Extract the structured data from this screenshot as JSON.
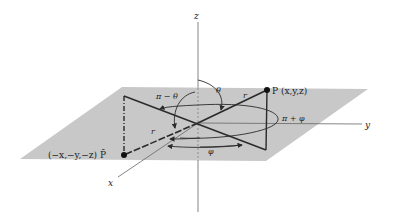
{
  "figure": {
    "axes": {
      "x_label": "x",
      "y_label": "y",
      "z_label": "z"
    },
    "points": {
      "P_label": "P (x,y,z)",
      "P_bar_label": "(−x,−y,−z) P̄"
    },
    "annotations": {
      "theta": "θ",
      "pi_minus_theta": "π − θ",
      "phi": "φ",
      "pi_plus_phi": "π + φ",
      "r_upper": "r",
      "r_lower": "r"
    },
    "colors": {
      "plane": "#c8c8c8",
      "lines": "#2a2a2a",
      "axes": "#555555"
    }
  }
}
